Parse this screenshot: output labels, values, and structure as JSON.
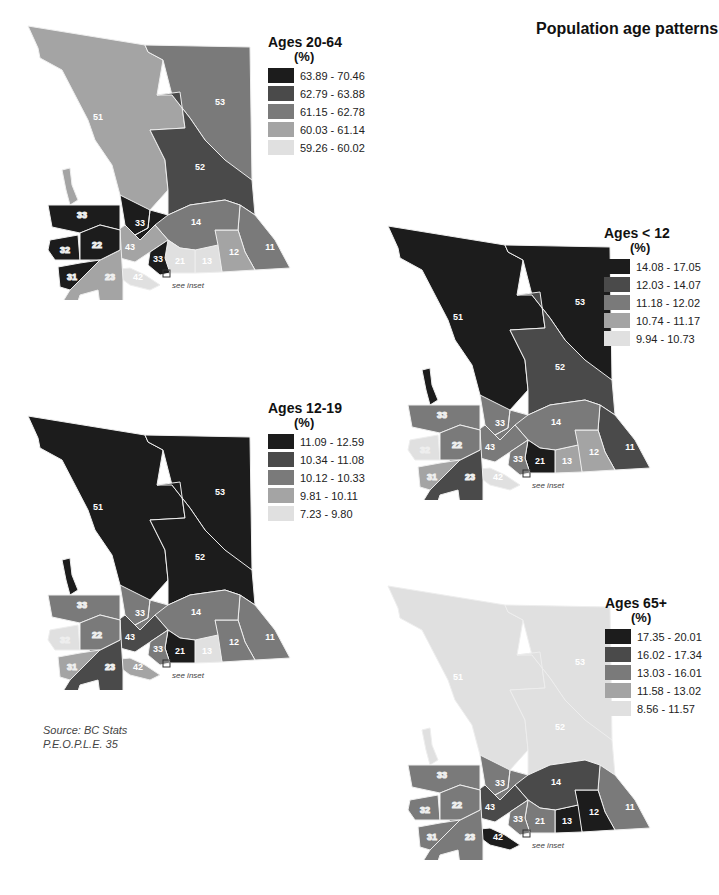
{
  "header": {
    "title": "Population age patterns"
  },
  "source": {
    "line1": "Source: BC Stats",
    "line2": "P.E.O.P.L.E. 35"
  },
  "inset_note": "see inset",
  "shades": [
    "#1c1c1c",
    "#4a4a4a",
    "#7a7a7a",
    "#a4a4a4",
    "#e0e0e0"
  ],
  "maps": [
    {
      "id": "ages-20-64",
      "title": "Ages 20-64",
      "unit": "(%)",
      "legend": [
        "63.89 - 70.46",
        "62.79 - 63.88",
        "61.15 - 62.78",
        "60.03 - 61.14",
        "59.26 - 60.02"
      ],
      "regions": {
        "51": 3,
        "52": 1,
        "53": 2,
        "33": 0,
        "14": 2,
        "43": 3,
        "21": 4,
        "13": 4,
        "12": 3,
        "11": 2,
        "42": 4,
        "32": 0,
        "22": 0,
        "31": 0,
        "23": 3,
        "41": 0
      }
    },
    {
      "id": "ages-under-12",
      "title": "Ages < 12",
      "unit": "(%)",
      "legend": [
        "14.08 - 17.05",
        "12.03 - 14.07",
        "11.18 - 12.02",
        "10.74 - 11.17",
        "9.94 - 10.73"
      ],
      "regions": {
        "51": 0,
        "52": 1,
        "53": 0,
        "33": 2,
        "14": 2,
        "43": 2,
        "21": 0,
        "13": 3,
        "12": 3,
        "11": 1,
        "42": 4,
        "32": 4,
        "22": 2,
        "31": 3,
        "23": 1,
        "41": 3
      }
    },
    {
      "id": "ages-12-19",
      "title": "Ages 12-19",
      "unit": "(%)",
      "legend": [
        "11.09 - 12.59",
        "10.34 - 11.08",
        "10.12 - 10.33",
        "9.81 - 10.11",
        "7.23 - 9.80"
      ],
      "regions": {
        "51": 0,
        "52": 0,
        "53": 0,
        "33": 2,
        "14": 2,
        "43": 1,
        "21": 0,
        "13": 4,
        "12": 2,
        "11": 2,
        "42": 3,
        "32": 4,
        "22": 2,
        "31": 3,
        "23": 1,
        "41": 4
      }
    },
    {
      "id": "ages-65-plus",
      "title": "Ages 65+",
      "unit": "(%)",
      "legend": [
        "17.35 - 20.01",
        "16.02 - 17.34",
        "13.03 - 16.01",
        "11.58 - 13.02",
        "8.56 - 11.57"
      ],
      "regions": {
        "51": 4,
        "52": 4,
        "53": 4,
        "33": 2,
        "14": 1,
        "43": 1,
        "21": 2,
        "13": 0,
        "12": 0,
        "11": 2,
        "42": 0,
        "32": 2,
        "22": 2,
        "31": 2,
        "23": 2,
        "41": 1
      }
    }
  ],
  "chart_data": [
    {
      "type": "choropleth",
      "title": "Ages 20-64 (%)",
      "legend": [
        "63.89 - 70.46",
        "62.79 - 63.88",
        "61.15 - 62.78",
        "60.03 - 61.14",
        "59.26 - 60.02"
      ],
      "regions": {
        "11": "61.15 - 62.78",
        "12": "60.03 - 61.14",
        "13": "59.26 - 60.02",
        "14": "61.15 - 62.78",
        "21": "59.26 - 60.02",
        "22": "63.89 - 70.46",
        "23": "60.03 - 61.14",
        "31": "63.89 - 70.46",
        "32": "63.89 - 70.46",
        "33": "63.89 - 70.46",
        "42": "59.26 - 60.02",
        "43": "60.03 - 61.14",
        "51": "60.03 - 61.14",
        "52": "62.79 - 63.88",
        "53": "61.15 - 62.78"
      }
    },
    {
      "type": "choropleth",
      "title": "Ages < 12 (%)",
      "legend": [
        "14.08 - 17.05",
        "12.03 - 14.07",
        "11.18 - 12.02",
        "10.74 - 11.17",
        "9.94 - 10.73"
      ],
      "regions": {
        "11": "12.03 - 14.07",
        "12": "10.74 - 11.17",
        "13": "10.74 - 11.17",
        "14": "11.18 - 12.02",
        "21": "14.08 - 17.05",
        "22": "11.18 - 12.02",
        "23": "12.03 - 14.07",
        "31": "10.74 - 11.17",
        "32": "9.94 - 10.73",
        "33": "11.18 - 12.02",
        "42": "9.94 - 10.73",
        "43": "11.18 - 12.02",
        "51": "14.08 - 17.05",
        "52": "12.03 - 14.07",
        "53": "14.08 - 17.05"
      }
    },
    {
      "type": "choropleth",
      "title": "Ages 12-19 (%)",
      "legend": [
        "11.09 - 12.59",
        "10.34 - 11.08",
        "10.12 - 10.33",
        "9.81 - 10.11",
        "7.23 - 9.80"
      ],
      "regions": {
        "11": "10.12 - 10.33",
        "12": "10.12 - 10.33",
        "13": "7.23 - 9.80",
        "14": "10.12 - 10.33",
        "21": "11.09 - 12.59",
        "22": "10.12 - 10.33",
        "23": "10.34 - 11.08",
        "31": "9.81 - 10.11",
        "32": "7.23 - 9.80",
        "33": "10.12 - 10.33",
        "42": "9.81 - 10.11",
        "43": "10.34 - 11.08",
        "51": "11.09 - 12.59",
        "52": "11.09 - 12.59",
        "53": "11.09 - 12.59"
      }
    },
    {
      "type": "choropleth",
      "title": "Ages 65+ (%)",
      "legend": [
        "17.35 - 20.01",
        "16.02 - 17.34",
        "13.03 - 16.01",
        "11.58 - 13.02",
        "8.56 - 11.57"
      ],
      "regions": {
        "11": "13.03 - 16.01",
        "12": "17.35 - 20.01",
        "13": "17.35 - 20.01",
        "14": "16.02 - 17.34",
        "21": "13.03 - 16.01",
        "22": "13.03 - 16.01",
        "23": "13.03 - 16.01",
        "31": "13.03 - 16.01",
        "32": "13.03 - 16.01",
        "33": "13.03 - 16.01",
        "42": "17.35 - 20.01",
        "43": "16.02 - 17.34",
        "51": "8.56 - 11.57",
        "52": "8.56 - 11.57",
        "53": "8.56 - 11.57"
      }
    }
  ]
}
